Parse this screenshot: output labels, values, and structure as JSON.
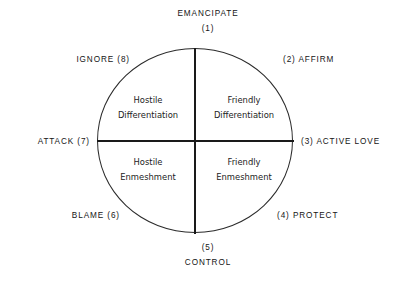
{
  "diagram": {
    "shape": "circle-with-crossed-diameters",
    "stroke_color": "#1a1a1a",
    "background_color": "#ffffff"
  },
  "poles": {
    "emancipate": {
      "label": "EMANCIPATE",
      "number": "(1)",
      "position": "top"
    },
    "affirm": {
      "label": "(2) AFFIRM",
      "position": "upper-right"
    },
    "active_love": {
      "label": "(3) ACTIVE LOVE",
      "position": "right"
    },
    "protect": {
      "label": "(4) PROTECT",
      "position": "lower-right"
    },
    "control": {
      "label": "CONTROL",
      "number": "(5)",
      "position": "bottom"
    },
    "blame": {
      "label": "BLAME (6)",
      "position": "lower-left"
    },
    "attack": {
      "label": "ATTACK (7)",
      "position": "left"
    },
    "ignore": {
      "label": "IGNORE (8)",
      "position": "upper-left"
    }
  },
  "quadrants": {
    "top_left": {
      "line1": "Hostile",
      "line2": "Differentiation"
    },
    "top_right": {
      "line1": "Friendly",
      "line2": "Differentiation"
    },
    "bottom_left": {
      "line1": "Hostile",
      "line2": "Enmeshment"
    },
    "bottom_right": {
      "line1": "Friendly",
      "line2": "Enmeshment"
    }
  }
}
